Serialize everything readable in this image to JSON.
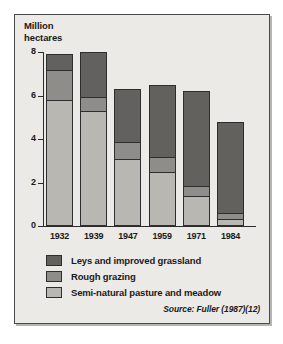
{
  "chart_data": {
    "type": "bar",
    "subtype": "stacked-bar",
    "title": "Million\nhectares",
    "xlabel": "",
    "ylabel": "Million hectares",
    "ylim": [
      0,
      8
    ],
    "yticks": [
      0,
      2,
      4,
      6,
      8
    ],
    "ytick_labels": [
      "0",
      "2",
      "4",
      "6",
      "8"
    ],
    "grid": false,
    "legend_position": "below-axes",
    "categories": [
      "1932",
      "1939",
      "1947",
      "1959",
      "1971",
      "1984"
    ],
    "series": [
      {
        "name": "Semi-natural pasture and meadow",
        "color": "#b9b7b2",
        "values": [
          5.8,
          5.3,
          3.1,
          2.5,
          1.4,
          0.3
        ]
      },
      {
        "name": "Rough grazing",
        "color": "#8f8d89",
        "values": [
          1.4,
          0.7,
          0.8,
          0.7,
          0.5,
          0.35
        ]
      },
      {
        "name": "Leys and improved grassland",
        "color": "#63615e",
        "values": [
          0.7,
          2.0,
          2.4,
          3.3,
          4.3,
          4.15
        ]
      }
    ],
    "totals": [
      7.9,
      8.0,
      6.3,
      6.5,
      6.2,
      4.8
    ],
    "annotations": {
      "source": "Source: Fuller (1987)(12)"
    }
  },
  "legend": {
    "items": [
      {
        "label": "Leys and improved grassland",
        "color": "#63615e"
      },
      {
        "label": "Rough grazing",
        "color": "#8f8d89"
      },
      {
        "label": "Semi-natural pasture and meadow",
        "color": "#b9b7b2"
      }
    ]
  },
  "source_note": "Source: Fuller (1987)(12)"
}
